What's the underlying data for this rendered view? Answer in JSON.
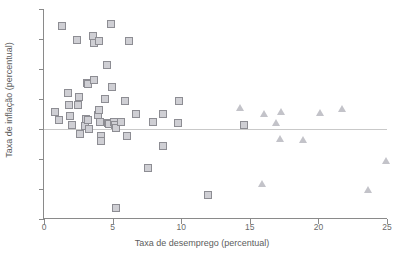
{
  "chart_data": {
    "type": "scatter",
    "title": "",
    "xlabel": "Taxa de desemprego (percentual)",
    "ylabel": "Taxa de inflação (percentual)",
    "xlim": [
      0,
      25
    ],
    "ylim": [
      -15,
      20
    ],
    "xticks": [
      0,
      5,
      10,
      15,
      20,
      25
    ],
    "yticks": [
      -15,
      -10,
      -5,
      0,
      5,
      10,
      15,
      20
    ],
    "xtick_labels": [
      "0",
      "5",
      "10",
      "15",
      "20",
      "25"
    ],
    "ytick_labels": [
      "-15",
      "-10",
      "-5",
      "0",
      "5",
      "10",
      "15",
      "20"
    ],
    "grid": false,
    "legend": "none",
    "reference_lines": [
      {
        "axis": "y",
        "value": 0,
        "color": "#c9c9c9"
      }
    ],
    "series": [
      {
        "name": "square-series",
        "marker": "square",
        "color": "#cfcfd4",
        "edge_color": "#8d8d93",
        "points": [
          [
            0.75,
            3.0
          ],
          [
            1.05,
            1.6
          ],
          [
            1.25,
            17.3
          ],
          [
            1.65,
            6.1
          ],
          [
            1.75,
            4.2
          ],
          [
            1.85,
            2.3
          ],
          [
            1.95,
            0.8
          ],
          [
            2.3,
            15.0
          ],
          [
            2.4,
            4.1
          ],
          [
            2.5,
            5.5
          ],
          [
            2.55,
            -0.7
          ],
          [
            2.9,
            0.7
          ],
          [
            3.0,
            1.9
          ],
          [
            3.05,
            7.8
          ],
          [
            3.1,
            1.6
          ],
          [
            3.15,
            7.6
          ],
          [
            3.2,
            0.1
          ],
          [
            3.5,
            15.7
          ],
          [
            3.55,
            14.5
          ],
          [
            3.6,
            8.4
          ],
          [
            3.85,
            2.5
          ],
          [
            3.9,
            14.9
          ],
          [
            3.95,
            3.4
          ],
          [
            4.0,
            1.3
          ],
          [
            4.05,
            -1.0
          ],
          [
            4.1,
            -1.8
          ],
          [
            4.35,
            5.1
          ],
          [
            4.55,
            10.8
          ],
          [
            4.6,
            1.2
          ],
          [
            4.65,
            1.0
          ],
          [
            4.8,
            17.6
          ],
          [
            4.9,
            7.2
          ],
          [
            5.05,
            1.4
          ],
          [
            5.1,
            0.9
          ],
          [
            5.15,
            0.3
          ],
          [
            5.2,
            -13.0
          ],
          [
            5.55,
            1.4
          ],
          [
            5.85,
            4.8
          ],
          [
            6.0,
            -1.0
          ],
          [
            6.1,
            14.9
          ],
          [
            6.6,
            2.7
          ],
          [
            7.5,
            -6.3
          ],
          [
            7.9,
            1.4
          ],
          [
            8.6,
            2.7
          ],
          [
            8.6,
            -2.6
          ],
          [
            9.7,
            1.1
          ],
          [
            9.8,
            4.9
          ],
          [
            11.9,
            -10.8
          ],
          [
            14.5,
            0.8
          ]
        ]
      },
      {
        "name": "triangle-series",
        "marker": "triangle",
        "color": "#c3c3c9",
        "edge_color": "#a9a9b0",
        "points": [
          [
            14.3,
            3.6
          ],
          [
            15.9,
            -9.0
          ],
          [
            16.0,
            2.6
          ],
          [
            16.9,
            1.1
          ],
          [
            17.2,
            -1.5
          ],
          [
            17.3,
            2.9
          ],
          [
            18.9,
            -1.8
          ],
          [
            20.1,
            2.8
          ],
          [
            21.7,
            3.5
          ],
          [
            23.6,
            -10.1
          ],
          [
            24.9,
            -5.2
          ]
        ]
      }
    ]
  }
}
